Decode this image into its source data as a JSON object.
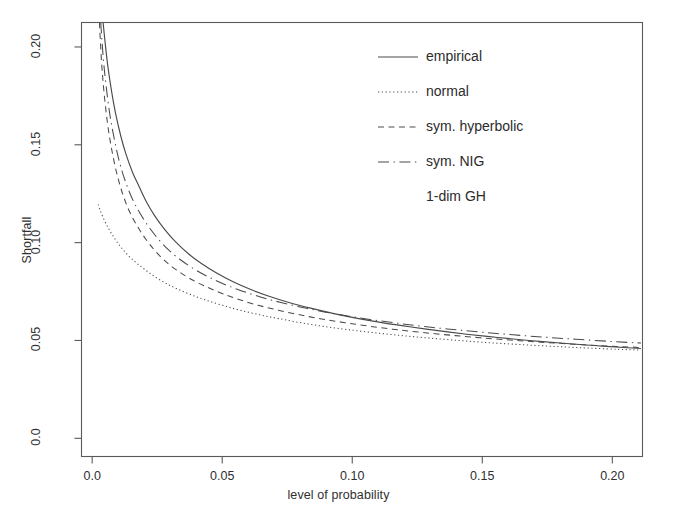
{
  "chart_data": {
    "type": "line",
    "title": "",
    "xlabel": "level of probability",
    "ylabel": "Shortfall",
    "xlim": [
      -0.0041,
      0.2116
    ],
    "ylim": [
      -0.0093,
      0.2125
    ],
    "xticks": [
      0.0,
      0.05,
      0.1,
      0.15,
      0.2
    ],
    "xtick_labels": [
      "0.0",
      "0.05",
      "0.10",
      "0.15",
      "0.20"
    ],
    "yticks": [
      0.0,
      0.05,
      0.1,
      0.15,
      0.2
    ],
    "ytick_labels": [
      "0.0",
      "0.05",
      "0.10",
      "0.15",
      "0.20"
    ],
    "grid": false,
    "frame": true,
    "legend_position": "top-right",
    "line_color": "#4a4a4a",
    "axis_color": "#5a5a5a",
    "series": [
      {
        "name": "empirical",
        "style": "solid",
        "x": [
          0.0042,
          0.005,
          0.006,
          0.0075,
          0.009,
          0.011,
          0.013,
          0.0155,
          0.018,
          0.021,
          0.024,
          0.028,
          0.032,
          0.037,
          0.042,
          0.048,
          0.054,
          0.061,
          0.068,
          0.076,
          0.084,
          0.093,
          0.102,
          0.112,
          0.122,
          0.133,
          0.144,
          0.156,
          0.168,
          0.18,
          0.193,
          0.206,
          0.211
        ],
        "y": [
          0.2125,
          0.202,
          0.1905,
          0.177,
          0.166,
          0.1545,
          0.1452,
          0.136,
          0.1288,
          0.1205,
          0.1138,
          0.1065,
          0.1005,
          0.0943,
          0.0893,
          0.0843,
          0.0801,
          0.076,
          0.0726,
          0.0693,
          0.0665,
          0.0637,
          0.0613,
          0.059,
          0.057,
          0.055,
          0.0532,
          0.0515,
          0.05,
          0.0487,
          0.0474,
          0.0463,
          0.0459
        ]
      },
      {
        "name": "normal",
        "style": "dotted",
        "x": [
          0.0023,
          0.003,
          0.004,
          0.0055,
          0.0072,
          0.0092,
          0.0115,
          0.0142,
          0.0172,
          0.0205,
          0.0242,
          0.0285,
          0.033,
          0.0385,
          0.044,
          0.0505,
          0.057,
          0.0645,
          0.072,
          0.0805,
          0.089,
          0.098,
          0.1075,
          0.1175,
          0.128,
          0.139,
          0.15,
          0.162,
          0.174,
          0.186,
          0.198,
          0.206,
          0.211
        ],
        "y": [
          0.1195,
          0.1168,
          0.1135,
          0.1092,
          0.1052,
          0.101,
          0.097,
          0.093,
          0.0894,
          0.086,
          0.0825,
          0.0791,
          0.0762,
          0.0731,
          0.0705,
          0.0678,
          0.0654,
          0.0631,
          0.0611,
          0.059,
          0.0572,
          0.0556,
          0.0541,
          0.0527,
          0.0514,
          0.0502,
          0.0491,
          0.0481,
          0.0472,
          0.0464,
          0.0457,
          0.0453,
          0.0451
        ]
      },
      {
        "name": "sym. hyperbolic",
        "style": "dashed",
        "x": [
          0.0028,
          0.0036,
          0.0046,
          0.006,
          0.0076,
          0.0095,
          0.0117,
          0.0143,
          0.0172,
          0.0205,
          0.0242,
          0.0283,
          0.0328,
          0.0382,
          0.0438,
          0.05,
          0.0565,
          0.0638,
          0.0715,
          0.0798,
          0.0882,
          0.0972,
          0.1065,
          0.1165,
          0.1268,
          0.1378,
          0.149,
          0.1608,
          0.1728,
          0.185,
          0.1972,
          0.206,
          0.211
        ],
        "y": [
          0.2125,
          0.1925,
          0.1762,
          0.16,
          0.147,
          0.1352,
          0.125,
          0.116,
          0.1088,
          0.102,
          0.0958,
          0.0903,
          0.0857,
          0.0812,
          0.0775,
          0.074,
          0.0709,
          0.068,
          0.0655,
          0.0631,
          0.061,
          0.0591,
          0.0573,
          0.0556,
          0.0541,
          0.0527,
          0.0514,
          0.0502,
          0.0491,
          0.0481,
          0.0472,
          0.0467,
          0.0464
        ]
      },
      {
        "name": "sym. NIG",
        "style": "dashdot",
        "x": [
          0.0033,
          0.0042,
          0.0053,
          0.0068,
          0.0085,
          0.0105,
          0.0128,
          0.0155,
          0.0185,
          0.0218,
          0.0255,
          0.0296,
          0.0342,
          0.0395,
          0.045,
          0.0512,
          0.0578,
          0.065,
          0.0726,
          0.0808,
          0.0892,
          0.0982,
          0.1075,
          0.1175,
          0.1278,
          0.1388,
          0.15,
          0.1618,
          0.1738,
          0.186,
          0.1982,
          0.2062,
          0.211
        ],
        "y": [
          0.2125,
          0.1955,
          0.1808,
          0.1655,
          0.153,
          0.1412,
          0.1312,
          0.1222,
          0.1148,
          0.108,
          0.1017,
          0.096,
          0.091,
          0.0863,
          0.0823,
          0.0785,
          0.0752,
          0.0721,
          0.0694,
          0.0669,
          0.0646,
          0.0625,
          0.0606,
          0.0588,
          0.0571,
          0.0556,
          0.0542,
          0.0529,
          0.0517,
          0.0506,
          0.0496,
          0.049,
          0.0487
        ]
      },
      {
        "name": "1-dim GH",
        "style": "none",
        "x": [],
        "y": []
      }
    ]
  },
  "legend": {
    "entries": [
      {
        "label": "empirical",
        "style": "solid"
      },
      {
        "label": "normal",
        "style": "dotted"
      },
      {
        "label": "sym. hyperbolic",
        "style": "dashed"
      },
      {
        "label": "sym. NIG",
        "style": "dashdot"
      },
      {
        "label": "1-dim GH",
        "style": "none"
      }
    ]
  }
}
